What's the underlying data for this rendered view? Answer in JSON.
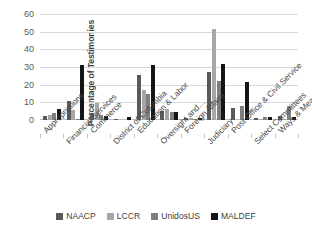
{
  "chart_data": {
    "type": "bar",
    "title": "",
    "xlabel": "",
    "ylabel": "Percentage of Testimonies",
    "ylim": [
      0,
      60
    ],
    "yticks": [
      0,
      10,
      20,
      30,
      40,
      50,
      60
    ],
    "grid": true,
    "legend_position": "bottom",
    "categories": [
      "Appropriations",
      "Financial Services",
      "Commerce",
      "District of Columbia",
      "Education & Labor",
      "Oversight and…",
      "Foreign Affairs",
      "Judiciary",
      "Post Office & Civil Service",
      "Select Committees",
      "Ways & Means"
    ],
    "series": [
      {
        "name": "NAACP",
        "color": "#595959",
        "values": [
          2.5,
          11.0,
          4.0,
          0.6,
          25.7,
          5.0,
          1.0,
          27.0,
          7.0,
          1.4,
          2.0
        ]
      },
      {
        "name": "LCCR",
        "color": "#a6a6a6",
        "values": [
          3.0,
          5.5,
          9.7,
          0.0,
          17.0,
          6.0,
          0.9,
          51.8,
          0.0,
          0.2,
          0.3
        ]
      },
      {
        "name": "UnidosUS",
        "color": "#7f7f7f",
        "values": [
          4.0,
          0.3,
          3.0,
          0.0,
          14.7,
          4.5,
          0.6,
          22.3,
          7.7,
          1.5,
          8.0
        ]
      },
      {
        "name": "MALDEF",
        "color": "#151515",
        "values": [
          6.3,
          31.4,
          2.2,
          1.5,
          31.3,
          4.5,
          1.0,
          31.5,
          21.8,
          1.5,
          1.5
        ]
      }
    ]
  },
  "legend": {
    "items": [
      {
        "label": "NAACP"
      },
      {
        "label": "LCCR"
      },
      {
        "label": "UnidosUS"
      },
      {
        "label": "MALDEF"
      }
    ]
  }
}
